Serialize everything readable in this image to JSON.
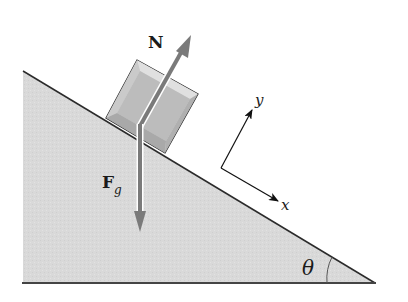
{
  "diagram": {
    "labels": {
      "normal_force": "N",
      "gravity_force_main": "F",
      "gravity_force_sub": "g",
      "axis_x": "x",
      "axis_y": "y",
      "angle": "θ"
    },
    "colors": {
      "background": "#ffffff",
      "incline_fill": "#d9d9d9",
      "incline_edge": "#2b2b2b",
      "block_face": "#d6d6d6",
      "block_inner": "#bdbdbd",
      "block_edge": "#222222",
      "force_arrow": "#7a7a7a",
      "axis_arrow": "#111111"
    }
  }
}
